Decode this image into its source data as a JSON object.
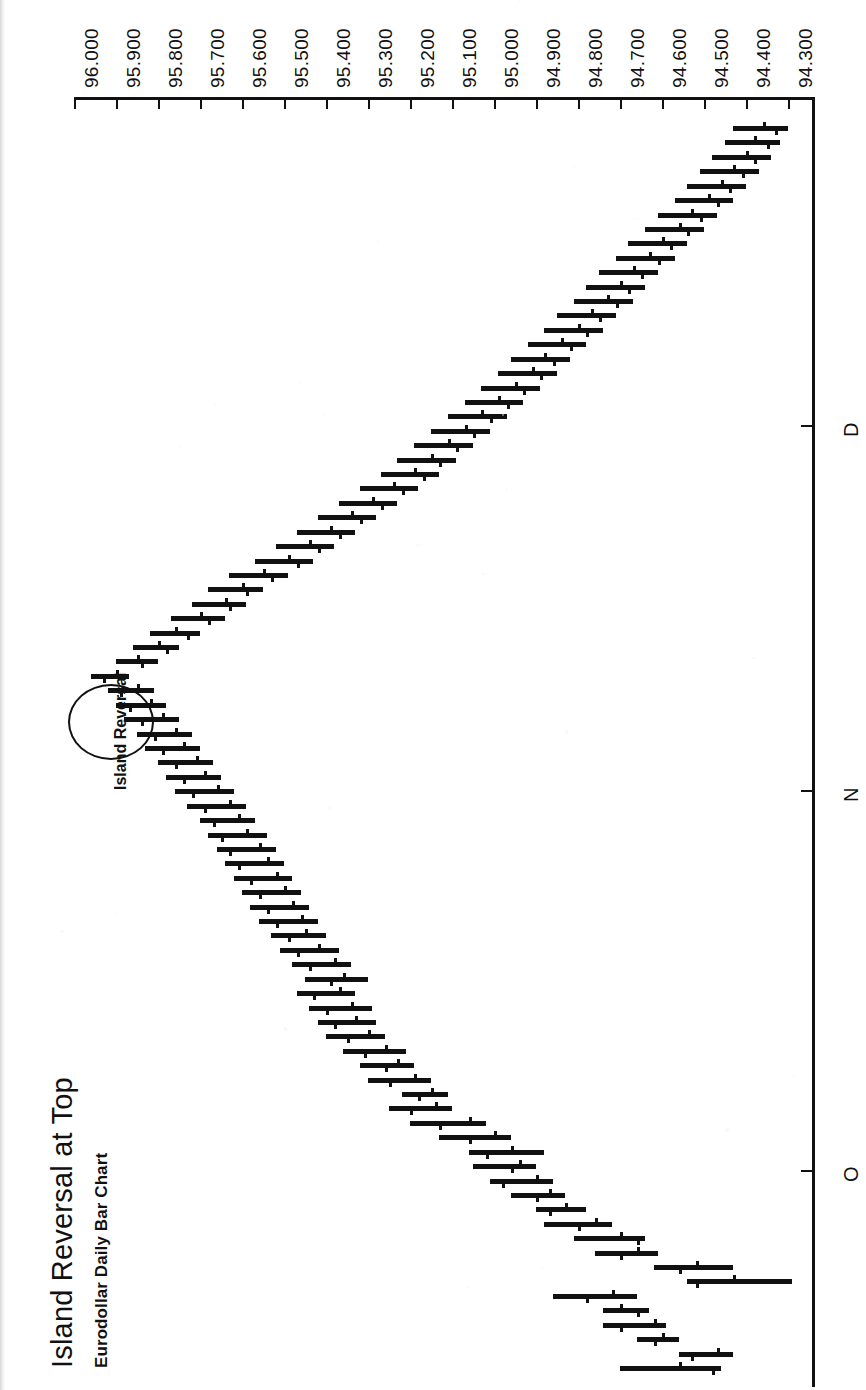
{
  "title": "Island Reversal at Top",
  "subtitle": "Eurodollar Daily Bar Chart",
  "annotation": "Island Reversal",
  "chart_data": {
    "type": "bar",
    "chart_style": "ohlc-bar",
    "title": "Island Reversal at Top",
    "subtitle": "Eurodollar Daily Bar Chart",
    "xlabel": "",
    "ylabel": "",
    "orientation": "rotated-90ccw",
    "grid": false,
    "legend": null,
    "annotations": [
      {
        "text": "Island Reversal",
        "marker": "ellipse",
        "target_index": 48
      }
    ],
    "value_axis": {
      "ticks": [
        "96.000",
        "95.900",
        "95.800",
        "95.700",
        "95.600",
        "95.500",
        "95.400",
        "95.300",
        "95.200",
        "95.100",
        "95.000",
        "94.900",
        "94.800",
        "94.700",
        "94.600",
        "94.500",
        "94.400",
        "94.300"
      ],
      "min": 94.3,
      "max": 96.0,
      "step": 0.1
    },
    "time_axis": {
      "tick_labels": [
        "O",
        "N",
        "D"
      ],
      "tick_label_names": [
        "October",
        "November",
        "December"
      ]
    },
    "ohlc": [
      {
        "o": 94.56,
        "h": 94.7,
        "l": 94.46,
        "c": 94.48
      },
      {
        "o": 94.47,
        "h": 94.56,
        "l": 94.43,
        "c": 94.53
      },
      {
        "o": 94.6,
        "h": 94.66,
        "l": 94.56,
        "c": 94.62
      },
      {
        "o": 94.62,
        "h": 94.74,
        "l": 94.59,
        "c": 94.7
      },
      {
        "o": 94.7,
        "h": 94.74,
        "l": 94.63,
        "c": 94.66
      },
      {
        "o": 94.72,
        "h": 94.86,
        "l": 94.66,
        "c": 94.78
      },
      {
        "o": 94.43,
        "h": 94.54,
        "l": 94.29,
        "c": 94.52
      },
      {
        "o": 94.52,
        "h": 94.62,
        "l": 94.43,
        "c": 94.56
      },
      {
        "o": 94.66,
        "h": 94.76,
        "l": 94.61,
        "c": 94.7
      },
      {
        "o": 94.7,
        "h": 94.81,
        "l": 94.64,
        "c": 94.66
      },
      {
        "o": 94.76,
        "h": 94.88,
        "l": 94.72,
        "c": 94.8
      },
      {
        "o": 94.83,
        "h": 94.9,
        "l": 94.78,
        "c": 94.87
      },
      {
        "o": 94.87,
        "h": 94.96,
        "l": 94.83,
        "c": 94.9
      },
      {
        "o": 94.9,
        "h": 95.01,
        "l": 94.86,
        "c": 94.98
      },
      {
        "o": 94.94,
        "h": 95.05,
        "l": 94.9,
        "c": 94.96
      },
      {
        "o": 94.96,
        "h": 95.06,
        "l": 94.88,
        "c": 95.02
      },
      {
        "o": 95.0,
        "h": 95.13,
        "l": 94.96,
        "c": 95.06
      },
      {
        "o": 95.06,
        "h": 95.2,
        "l": 95.02,
        "c": 95.13
      },
      {
        "o": 95.14,
        "h": 95.25,
        "l": 95.1,
        "c": 95.2
      },
      {
        "o": 95.15,
        "h": 95.22,
        "l": 95.11,
        "c": 95.18
      },
      {
        "o": 95.19,
        "h": 95.3,
        "l": 95.15,
        "c": 95.25
      },
      {
        "o": 95.23,
        "h": 95.32,
        "l": 95.19,
        "c": 95.26
      },
      {
        "o": 95.26,
        "h": 95.36,
        "l": 95.21,
        "c": 95.31
      },
      {
        "o": 95.3,
        "h": 95.4,
        "l": 95.26,
        "c": 95.35
      },
      {
        "o": 95.33,
        "h": 95.42,
        "l": 95.28,
        "c": 95.38
      },
      {
        "o": 95.34,
        "h": 95.44,
        "l": 95.29,
        "c": 95.4
      },
      {
        "o": 95.37,
        "h": 95.47,
        "l": 95.33,
        "c": 95.43
      },
      {
        "o": 95.36,
        "h": 95.45,
        "l": 95.3,
        "c": 95.39
      },
      {
        "o": 95.38,
        "h": 95.48,
        "l": 95.34,
        "c": 95.44
      },
      {
        "o": 95.42,
        "h": 95.51,
        "l": 95.37,
        "c": 95.47
      },
      {
        "o": 95.45,
        "h": 95.53,
        "l": 95.4,
        "c": 95.49
      },
      {
        "o": 95.46,
        "h": 95.56,
        "l": 95.42,
        "c": 95.52
      },
      {
        "o": 95.48,
        "h": 95.58,
        "l": 95.44,
        "c": 95.54
      },
      {
        "o": 95.5,
        "h": 95.6,
        "l": 95.46,
        "c": 95.56
      },
      {
        "o": 95.52,
        "h": 95.62,
        "l": 95.48,
        "c": 95.58
      },
      {
        "o": 95.54,
        "h": 95.64,
        "l": 95.5,
        "c": 95.61
      },
      {
        "o": 95.56,
        "h": 95.66,
        "l": 95.52,
        "c": 95.63
      },
      {
        "o": 95.59,
        "h": 95.68,
        "l": 95.54,
        "c": 95.65
      },
      {
        "o": 95.61,
        "h": 95.7,
        "l": 95.57,
        "c": 95.67
      },
      {
        "o": 95.63,
        "h": 95.73,
        "l": 95.59,
        "c": 95.69
      },
      {
        "o": 95.66,
        "h": 95.76,
        "l": 95.62,
        "c": 95.72
      },
      {
        "o": 95.69,
        "h": 95.78,
        "l": 95.65,
        "c": 95.74
      },
      {
        "o": 95.71,
        "h": 95.8,
        "l": 95.67,
        "c": 95.76
      },
      {
        "o": 95.74,
        "h": 95.83,
        "l": 95.7,
        "c": 95.79
      },
      {
        "o": 95.76,
        "h": 95.85,
        "l": 95.72,
        "c": 95.81
      },
      {
        "o": 95.79,
        "h": 95.88,
        "l": 95.75,
        "c": 95.84
      },
      {
        "o": 95.82,
        "h": 95.9,
        "l": 95.78,
        "c": 95.87
      },
      {
        "o": 95.85,
        "h": 95.92,
        "l": 95.81,
        "c": 95.89
      },
      {
        "o": 95.9,
        "h": 95.96,
        "l": 95.87,
        "c": 95.93
      },
      {
        "o": 95.85,
        "h": 95.9,
        "l": 95.8,
        "c": 95.84
      },
      {
        "o": 95.8,
        "h": 95.86,
        "l": 95.75,
        "c": 95.78
      },
      {
        "o": 95.76,
        "h": 95.82,
        "l": 95.7,
        "c": 95.73
      },
      {
        "o": 95.7,
        "h": 95.77,
        "l": 95.64,
        "c": 95.68
      },
      {
        "o": 95.64,
        "h": 95.72,
        "l": 95.59,
        "c": 95.63
      },
      {
        "o": 95.6,
        "h": 95.68,
        "l": 95.55,
        "c": 95.59
      },
      {
        "o": 95.55,
        "h": 95.63,
        "l": 95.49,
        "c": 95.53
      },
      {
        "o": 95.49,
        "h": 95.57,
        "l": 95.43,
        "c": 95.47
      },
      {
        "o": 95.44,
        "h": 95.52,
        "l": 95.38,
        "c": 95.42
      },
      {
        "o": 95.39,
        "h": 95.47,
        "l": 95.33,
        "c": 95.37
      },
      {
        "o": 95.34,
        "h": 95.42,
        "l": 95.28,
        "c": 95.32
      },
      {
        "o": 95.29,
        "h": 95.37,
        "l": 95.23,
        "c": 95.27
      },
      {
        "o": 95.24,
        "h": 95.32,
        "l": 95.18,
        "c": 95.22
      },
      {
        "o": 95.19,
        "h": 95.27,
        "l": 95.13,
        "c": 95.17
      },
      {
        "o": 95.15,
        "h": 95.23,
        "l": 95.09,
        "c": 95.13
      },
      {
        "o": 95.11,
        "h": 95.19,
        "l": 95.05,
        "c": 95.09
      },
      {
        "o": 95.07,
        "h": 95.15,
        "l": 95.01,
        "c": 95.05
      },
      {
        "o": 95.03,
        "h": 95.11,
        "l": 94.97,
        "c": 95.01
      },
      {
        "o": 94.99,
        "h": 95.07,
        "l": 94.93,
        "c": 94.97
      },
      {
        "o": 94.95,
        "h": 95.03,
        "l": 94.89,
        "c": 94.93
      },
      {
        "o": 94.91,
        "h": 94.99,
        "l": 94.85,
        "c": 94.89
      },
      {
        "o": 94.88,
        "h": 94.96,
        "l": 94.82,
        "c": 94.86
      },
      {
        "o": 94.84,
        "h": 94.92,
        "l": 94.78,
        "c": 94.82
      },
      {
        "o": 94.8,
        "h": 94.88,
        "l": 94.74,
        "c": 94.78
      },
      {
        "o": 94.77,
        "h": 94.85,
        "l": 94.71,
        "c": 94.75
      },
      {
        "o": 94.73,
        "h": 94.81,
        "l": 94.67,
        "c": 94.71
      },
      {
        "o": 94.7,
        "h": 94.78,
        "l": 94.64,
        "c": 94.68
      },
      {
        "o": 94.67,
        "h": 94.75,
        "l": 94.61,
        "c": 94.65
      },
      {
        "o": 94.63,
        "h": 94.71,
        "l": 94.57,
        "c": 94.61
      },
      {
        "o": 94.6,
        "h": 94.68,
        "l": 94.54,
        "c": 94.58
      },
      {
        "o": 94.56,
        "h": 94.64,
        "l": 94.5,
        "c": 94.54
      },
      {
        "o": 94.53,
        "h": 94.61,
        "l": 94.47,
        "c": 94.51
      },
      {
        "o": 94.49,
        "h": 94.57,
        "l": 94.43,
        "c": 94.47
      },
      {
        "o": 94.46,
        "h": 94.54,
        "l": 94.4,
        "c": 94.44
      },
      {
        "o": 94.43,
        "h": 94.51,
        "l": 94.37,
        "c": 94.41
      },
      {
        "o": 94.4,
        "h": 94.48,
        "l": 94.34,
        "c": 94.38
      },
      {
        "o": 94.38,
        "h": 94.45,
        "l": 94.32,
        "c": 94.35
      },
      {
        "o": 94.36,
        "h": 94.43,
        "l": 94.3,
        "c": 94.33
      }
    ]
  }
}
